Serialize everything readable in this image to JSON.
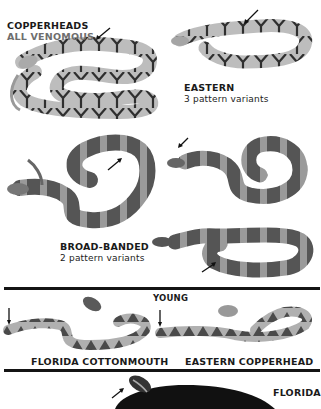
{
  "header": {
    "title": "COPPERHEADS",
    "subtitle": "ALL VENOMOUS"
  },
  "groups": [
    {
      "name": "EASTERN",
      "detail": "3 pattern variants"
    },
    {
      "name": "BROAD-BANDED",
      "detail": "2 pattern variants"
    }
  ],
  "young": {
    "heading": "YOUNG",
    "items": [
      {
        "label": "FLORIDA COTTONMOUTH"
      },
      {
        "label": "EASTERN COPPERHEAD"
      }
    ]
  },
  "bottom": {
    "label": "FLORIDA"
  },
  "colors": {
    "light_body": "#b9b9b9",
    "dark_band": "#4a4a4a",
    "mid_band": "#8a8a8a",
    "rule": "#141414",
    "text": "#1a1a1a",
    "subtitle_grey": "#6e6e6e"
  }
}
